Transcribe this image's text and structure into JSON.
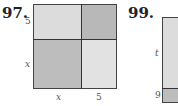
{
  "problems": [
    {
      "number": "97.",
      "figure": {
        "shape": "square divided into 4 regions",
        "side_labels_left": [
          "5",
          "x"
        ],
        "side_labels_bottom": [
          "x",
          "5"
        ],
        "colors": {
          "top_left": "#dcdcdc",
          "top_right": "#b8b8b8",
          "bottom_left": "#bdbdbd",
          "bottom_right": "#e2e2e2"
        }
      }
    },
    {
      "number": "99.",
      "figure": {
        "shape": "rectangle divided into regions (partially visible)",
        "side_labels_left": [
          "t",
          "9"
        ],
        "colors": {
          "top": "#dcdcdc",
          "bottom": "#bdbdbd"
        }
      }
    }
  ]
}
